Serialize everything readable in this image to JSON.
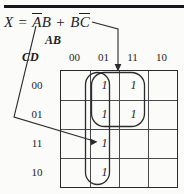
{
  "figure": {
    "equation": {
      "lhs": "X",
      "equals": "=",
      "term1_a": "A",
      "term1_b": "B",
      "plus": "+",
      "term2_b": "B",
      "term2_c": "C",
      "full_text": "X = AB + BC"
    },
    "axis": {
      "column_group_label": "AB",
      "row_group_label": "CD"
    },
    "column_headers": [
      "00",
      "01",
      "11",
      "10"
    ],
    "row_headers": [
      "00",
      "01",
      "11",
      "10"
    ],
    "cells": [
      [
        "",
        "1",
        "1",
        ""
      ],
      [
        "",
        "1",
        "1",
        ""
      ],
      [
        "",
        "1",
        "",
        ""
      ],
      [
        "",
        "1",
        "",
        ""
      ]
    ],
    "groups": [
      {
        "name": "group-bc-horizontal",
        "label": "BC",
        "columns": [
          "01",
          "11"
        ],
        "rows": [
          "00",
          "01"
        ]
      },
      {
        "name": "group-ab-vertical",
        "label": "AB",
        "columns": [
          "01"
        ],
        "rows": [
          "00",
          "01",
          "11",
          "10"
        ]
      }
    ],
    "colors": {
      "ink": "#1b1b1b",
      "grid": "#4a4a4d",
      "border": "#2b2b2e",
      "background": "#fbfbf9",
      "rule": "#17171a"
    }
  }
}
